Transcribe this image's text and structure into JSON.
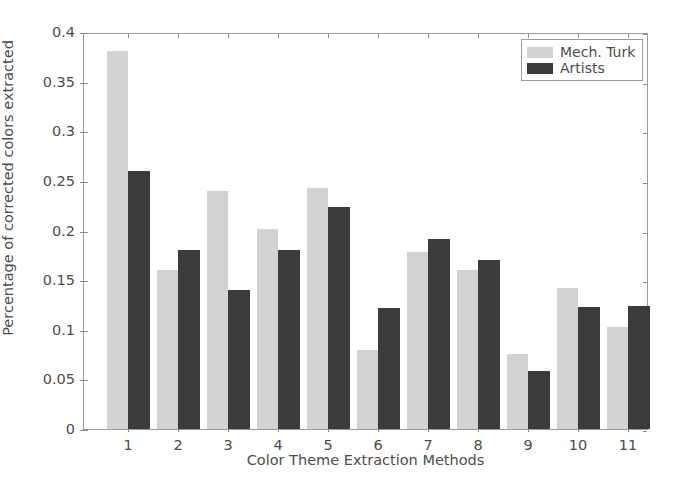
{
  "chart_data": {
    "type": "bar",
    "title": "",
    "xlabel": "Color Theme Extraction Methods",
    "ylabel": "Percentage of corrected colors extracted",
    "categories": [
      "1",
      "2",
      "3",
      "4",
      "5",
      "6",
      "7",
      "8",
      "9",
      "10",
      "11"
    ],
    "series": [
      {
        "name": "Mech. Turk",
        "color": "#d2d2d2",
        "values": [
          0.381,
          0.16,
          0.24,
          0.202,
          0.243,
          0.08,
          0.178,
          0.16,
          0.076,
          0.142,
          0.103
        ]
      },
      {
        "name": "Artists",
        "color": "#3b3b3b",
        "values": [
          0.26,
          0.18,
          0.14,
          0.18,
          0.224,
          0.122,
          0.191,
          0.17,
          0.058,
          0.123,
          0.124
        ]
      }
    ],
    "ylim": [
      0,
      0.4
    ],
    "yticks": [
      0,
      0.05,
      0.1,
      0.15,
      0.2,
      0.25,
      0.3,
      0.35,
      0.4
    ],
    "ytick_labels": [
      "0",
      "0.05",
      "0.1",
      "0.15",
      "0.2",
      "0.25",
      "0.3",
      "0.35",
      "0.4"
    ],
    "grid": false,
    "legend_position": "upper right"
  },
  "legend": {
    "entries": [
      {
        "label": "Mech. Turk"
      },
      {
        "label": "Artists"
      }
    ]
  }
}
